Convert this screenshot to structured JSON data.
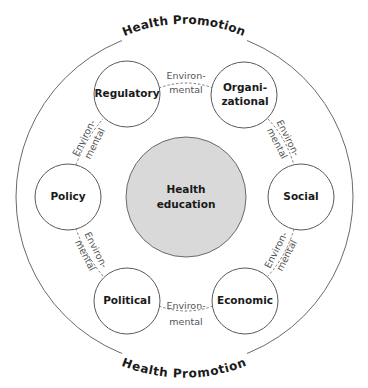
{
  "diagram": {
    "outer_ring": {
      "label_top": "Health Promotion",
      "label_bottom": "Health Promotion"
    },
    "center": {
      "line1": "Health",
      "line2": "education"
    },
    "nodes": [
      {
        "id": "regulatory",
        "line1": "Regulatory",
        "line2": ""
      },
      {
        "id": "organizational",
        "line1": "Organi-",
        "line2": "zational"
      },
      {
        "id": "social",
        "line1": "Social",
        "line2": ""
      },
      {
        "id": "economic",
        "line1": "Economic",
        "line2": ""
      },
      {
        "id": "political",
        "line1": "Political",
        "line2": ""
      },
      {
        "id": "policy",
        "line1": "Policy",
        "line2": ""
      }
    ],
    "edges": [
      {
        "from": "regulatory",
        "to": "organizational",
        "line1": "Environ-",
        "line2": "mental"
      },
      {
        "from": "organizational",
        "to": "social",
        "line1": "Environ-",
        "line2": "mental"
      },
      {
        "from": "social",
        "to": "economic",
        "line1": "Environ-",
        "line2": "mental"
      },
      {
        "from": "economic",
        "to": "political",
        "line1": "Environ-",
        "line2": "mental"
      },
      {
        "from": "political",
        "to": "policy",
        "line1": "Environ-",
        "line2": "mental"
      },
      {
        "from": "policy",
        "to": "regulatory",
        "line1": "Environ-",
        "line2": "mental"
      }
    ],
    "colors": {
      "center_fill": "#d9d9d9",
      "node_fill": "#ffffff",
      "stroke": "#5a5a5a",
      "text": "#1a1a1a",
      "edge_text": "#555555"
    }
  }
}
